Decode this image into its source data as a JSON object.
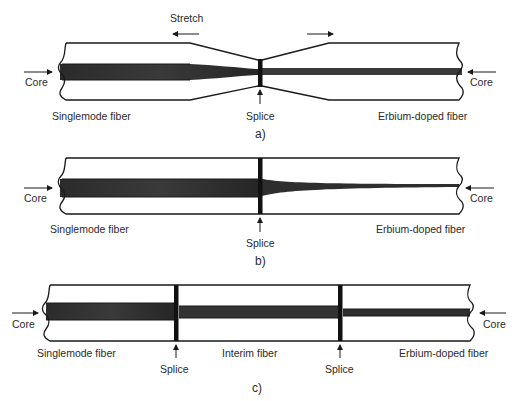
{
  "figure": {
    "colors": {
      "background": "#ffffff",
      "outline": "#1a1a1a",
      "core_dark": "#2e2e2e",
      "core_mid": "#4a4a4a",
      "text": "#2a2a2a"
    },
    "panels": [
      {
        "id": "a",
        "caption": "a)",
        "stretch_label": "Stretch",
        "core_label_left": "Core",
        "core_label_right": "Core",
        "left_fiber": "Singlemode fiber",
        "right_fiber": "Erbium-doped fiber",
        "splices": [
          "Splice"
        ]
      },
      {
        "id": "b",
        "caption": "b)",
        "core_label_left": "Core",
        "core_label_right": "Core",
        "left_fiber": "Singlemode fiber",
        "right_fiber": "Erbium-doped fiber",
        "splices": [
          "Splice"
        ]
      },
      {
        "id": "c",
        "caption": "c)",
        "core_label_left": "Core",
        "core_label_right": "Core",
        "left_fiber": "Singlemode fiber",
        "middle_fiber": "Interim fiber",
        "right_fiber": "Erbium-doped fiber",
        "splices": [
          "Splice",
          "Splice"
        ]
      }
    ]
  }
}
